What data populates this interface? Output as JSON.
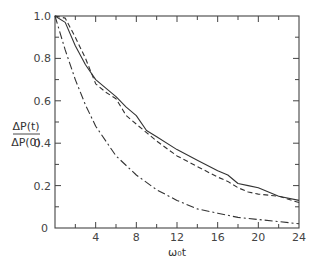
{
  "chart_data": {
    "type": "line",
    "title": "",
    "xlabel": "ω₀t",
    "ylabel_num": "ΔP(t)",
    "ylabel_den": "ΔP(0)",
    "xlim": [
      0,
      24
    ],
    "ylim": [
      0,
      1.0
    ],
    "x_ticks": [
      "4",
      "8",
      "12",
      "16",
      "20",
      "24"
    ],
    "x_tick_values": [
      4,
      8,
      12,
      16,
      20,
      24
    ],
    "x_origin_label": "0",
    "y_ticks": [
      "0",
      "0.2",
      "0.4",
      "0.6",
      "0.8",
      "1.0"
    ],
    "y_tick_values": [
      0,
      0.2,
      0.4,
      0.6,
      0.8,
      1.0
    ],
    "grid": false,
    "legend": null,
    "series": [
      {
        "name": "solid",
        "style": "solid",
        "x": [
          0,
          1,
          2,
          3,
          4,
          5,
          6,
          7,
          8,
          9,
          10,
          12,
          14,
          16,
          17,
          18,
          19,
          20,
          22,
          24
        ],
        "y": [
          1.0,
          0.97,
          0.86,
          0.77,
          0.7,
          0.66,
          0.62,
          0.57,
          0.53,
          0.46,
          0.43,
          0.37,
          0.32,
          0.27,
          0.25,
          0.21,
          0.2,
          0.19,
          0.15,
          0.13
        ]
      },
      {
        "name": "dashed",
        "style": "dashed",
        "x": [
          0,
          1,
          2,
          3,
          4,
          5,
          6,
          7,
          8,
          9,
          10,
          12,
          14,
          16,
          17,
          18,
          19,
          20,
          22,
          24
        ],
        "y": [
          1.0,
          0.99,
          0.9,
          0.8,
          0.68,
          0.64,
          0.61,
          0.53,
          0.49,
          0.45,
          0.41,
          0.34,
          0.29,
          0.24,
          0.22,
          0.19,
          0.17,
          0.16,
          0.15,
          0.12
        ]
      },
      {
        "name": "dash-dot",
        "style": "dashdot",
        "x": [
          0,
          1,
          2,
          3,
          4,
          6,
          8,
          10,
          12,
          14,
          16,
          18,
          20,
          22,
          24
        ],
        "y": [
          1.0,
          0.84,
          0.7,
          0.58,
          0.48,
          0.34,
          0.25,
          0.18,
          0.13,
          0.09,
          0.07,
          0.05,
          0.04,
          0.03,
          0.02
        ]
      }
    ]
  }
}
